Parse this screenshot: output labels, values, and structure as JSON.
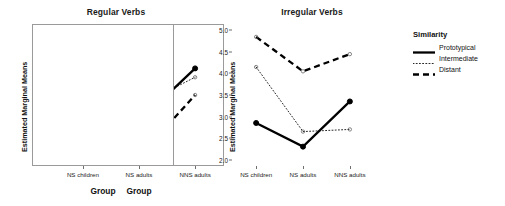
{
  "figure": {
    "xlabel": "Group",
    "ylabel": "Estimated Marginal Means",
    "categories": [
      "NS children",
      "NS adults",
      "NNS adults"
    ]
  },
  "legend": {
    "title": "Similarity",
    "entries": [
      {
        "label": "Prototypical",
        "style": "solid"
      },
      {
        "label": "Intermediate",
        "style": "dotted"
      },
      {
        "label": "Distant",
        "style": "dashed"
      }
    ]
  },
  "chart_data": [
    {
      "type": "line",
      "title": "Regular Verbs",
      "xlabel": "Group",
      "ylabel": "Estimated Marginal Means",
      "categories": [
        "NS children",
        "NS adults",
        "NNS adults"
      ],
      "ylim": [
        4.25,
        5.05
      ],
      "yticks": [
        "4.3",
        "4.4",
        "4.5",
        "4.6",
        "4.7",
        "4.8",
        "4.9",
        "5.0"
      ],
      "ytick_values": [
        4.3,
        4.4,
        4.5,
        4.6,
        4.7,
        4.8,
        4.9,
        5.0
      ],
      "grid": false,
      "legend_position": "right",
      "series": [
        {
          "name": "Prototypical",
          "style": "solid",
          "marker": "filled-circle",
          "values": [
            5.0,
            4.5,
            4.8
          ]
        },
        {
          "name": "Intermediate",
          "style": "dotted",
          "marker": "open-circle",
          "values": [
            4.97,
            4.59,
            4.75
          ]
        },
        {
          "name": "Distant",
          "style": "dashed",
          "marker": "open-circle",
          "values": [
            4.6,
            4.3,
            4.65
          ]
        }
      ]
    },
    {
      "type": "line",
      "title": "Irregular Verbs",
      "xlabel": "Group",
      "ylabel": "Estimated Marginal Means",
      "categories": [
        "NS children",
        "NS adults",
        "NNS adults"
      ],
      "ylim": [
        1.85,
        5.15
      ],
      "yticks": [
        "2.0",
        "2.5",
        "3.0",
        "3.5",
        "4.0",
        "4.5",
        "5.0"
      ],
      "ytick_values": [
        2.0,
        2.5,
        3.0,
        3.5,
        4.0,
        4.5,
        5.0
      ],
      "grid": false,
      "legend_position": "right",
      "series": [
        {
          "name": "Prototypical",
          "style": "solid",
          "marker": "filled-circle",
          "values": [
            2.85,
            2.3,
            3.35
          ]
        },
        {
          "name": "Intermediate",
          "style": "dotted",
          "marker": "open-circle",
          "values": [
            4.15,
            2.65,
            2.7
          ]
        },
        {
          "name": "Distant",
          "style": "dashed",
          "marker": "open-circle",
          "values": [
            4.85,
            4.05,
            4.45
          ]
        }
      ]
    }
  ]
}
